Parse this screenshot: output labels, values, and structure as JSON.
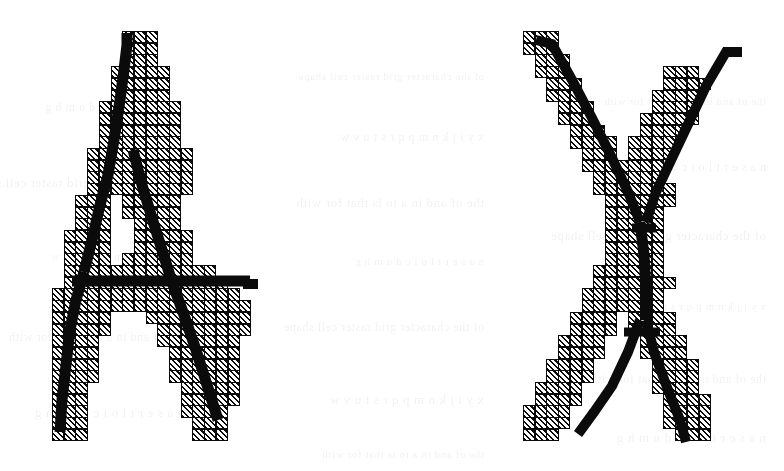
{
  "figure": {
    "background_color": "#ffffff",
    "ink_color": "#0b0b0b",
    "cell_fill": "diagonal-hatch",
    "cell_size_px": 11.7,
    "glyphs": [
      {
        "name": "glyph-a",
        "character": "A",
        "label": "A",
        "origin_x": 52,
        "origin_y": 31,
        "cols": 19,
        "rows": 35,
        "description": "Capital letter A digitized onto a square grid; hatched cells are the pixels selected by the digitizer, the heavy black line is the original outline of the character.",
        "rows_runs": [
          [
            [
              6,
              3
            ]
          ],
          [
            [
              6,
              3
            ]
          ],
          [
            [
              6,
              3
            ]
          ],
          [
            [
              5,
              5
            ]
          ],
          [
            [
              5,
              5
            ]
          ],
          [
            [
              5,
              5
            ]
          ],
          [
            [
              4,
              7
            ]
          ],
          [
            [
              4,
              7
            ]
          ],
          [
            [
              4,
              7
            ]
          ],
          [
            [
              4,
              7
            ]
          ],
          [
            [
              3,
              9
            ]
          ],
          [
            [
              3,
              9
            ]
          ],
          [
            [
              3,
              9
            ]
          ],
          [
            [
              3,
              9
            ]
          ],
          [
            [
              2,
              3
            ],
            [
              6,
              5
            ]
          ],
          [
            [
              2,
              3
            ],
            [
              6,
              5
            ]
          ],
          [
            [
              2,
              3
            ],
            [
              7,
              4
            ]
          ],
          [
            [
              1,
              4
            ],
            [
              7,
              5
            ]
          ],
          [
            [
              1,
              4
            ],
            [
              7,
              5
            ]
          ],
          [
            [
              1,
              4
            ],
            [
              6,
              6
            ]
          ],
          [
            [
              1,
              13
            ]
          ],
          [
            [
              1,
              14
            ]
          ],
          [
            [
              0,
              16
            ]
          ],
          [
            [
              0,
              17
            ]
          ],
          [
            [
              0,
              5
            ],
            [
              8,
              9
            ]
          ],
          [
            [
              0,
              5
            ],
            [
              9,
              8
            ]
          ],
          [
            [
              0,
              4
            ],
            [
              9,
              7
            ]
          ],
          [
            [
              0,
              4
            ],
            [
              10,
              6
            ]
          ],
          [
            [
              0,
              4
            ],
            [
              10,
              6
            ]
          ],
          [
            [
              0,
              4
            ],
            [
              10,
              6
            ]
          ],
          [
            [
              0,
              3
            ],
            [
              11,
              5
            ]
          ],
          [
            [
              0,
              3
            ],
            [
              11,
              5
            ]
          ],
          [
            [
              0,
              3
            ],
            [
              11,
              4
            ]
          ],
          [
            [
              0,
              3
            ],
            [
              12,
              3
            ]
          ],
          [
            [
              0,
              3
            ],
            [
              12,
              3
            ]
          ]
        ],
        "stroke_path": "M 121 33 L 121 190 M 121 33 L 112 33 M 112 33 L 103 100 M 103 100 L 86 190 M 86 190 L 62 320 M 62 320 L 58 430 M 58 430 L 78 430 M 121 190 L 150 260 M 150 260 L 185 330 M 185 330 L 215 415 M 80 285 L 250 285"
      },
      {
        "name": "glyph-x",
        "character": "X",
        "label": "X",
        "origin_x": 523,
        "origin_y": 31,
        "cols": 19,
        "rows": 35,
        "description": "Capital letter X digitized onto a square grid; hatched cells are the pixels selected by the digitizer, the heavy black line is the original outline of the character.",
        "rows_runs": [
          [
            [
              0,
              3
            ]
          ],
          [
            [
              0,
              3
            ]
          ],
          [
            [
              1,
              3
            ]
          ],
          [
            [
              1,
              3
            ],
            [
              12,
              3
            ]
          ],
          [
            [
              2,
              3
            ],
            [
              12,
              4
            ]
          ],
          [
            [
              2,
              3
            ],
            [
              11,
              4
            ]
          ],
          [
            [
              3,
              3
            ],
            [
              11,
              4
            ]
          ],
          [
            [
              3,
              3
            ],
            [
              10,
              5
            ]
          ],
          [
            [
              4,
              3
            ],
            [
              10,
              4
            ]
          ],
          [
            [
              4,
              4
            ],
            [
              9,
              4
            ]
          ],
          [
            [
              5,
              3
            ],
            [
              9,
              4
            ]
          ],
          [
            [
              5,
              4
            ],
            [
              8,
              4
            ]
          ],
          [
            [
              6,
              3
            ],
            [
              8,
              4
            ]
          ],
          [
            [
              6,
              7
            ]
          ],
          [
            [
              7,
              6
            ]
          ],
          [
            [
              7,
              5
            ]
          ],
          [
            [
              7,
              5
            ]
          ],
          [
            [
              7,
              5
            ]
          ],
          [
            [
              7,
              5
            ]
          ],
          [
            [
              7,
              5
            ]
          ],
          [
            [
              6,
              6
            ]
          ],
          [
            [
              6,
              7
            ]
          ],
          [
            [
              5,
              4
            ],
            [
              8,
              4
            ]
          ],
          [
            [
              5,
              4
            ],
            [
              8,
              4
            ]
          ],
          [
            [
              4,
              4
            ],
            [
              9,
              4
            ]
          ],
          [
            [
              4,
              4
            ],
            [
              9,
              4
            ]
          ],
          [
            [
              3,
              4
            ],
            [
              10,
              4
            ]
          ],
          [
            [
              3,
              4
            ],
            [
              10,
              4
            ]
          ],
          [
            [
              2,
              4
            ],
            [
              11,
              4
            ]
          ],
          [
            [
              2,
              4
            ],
            [
              11,
              4
            ]
          ],
          [
            [
              1,
              4
            ],
            [
              11,
              4
            ]
          ],
          [
            [
              1,
              4
            ],
            [
              12,
              4
            ]
          ],
          [
            [
              0,
              4
            ],
            [
              12,
              4
            ]
          ],
          [
            [
              0,
              4
            ],
            [
              12,
              4
            ]
          ],
          [
            [
              0,
              3
            ],
            [
              13,
              3
            ]
          ]
        ],
        "stroke_path": "M 537 40 L 560 40 M 560 40 L 648 250 M 648 250 L 700 400 M 700 400 L 690 440 M 745 50 L 730 50 M 730 50 L 700 55 M 700 55 L 640 200 M 640 200 L 600 300 M 600 300 L 555 400 M 555 400 L 548 415"
      }
    ]
  }
}
